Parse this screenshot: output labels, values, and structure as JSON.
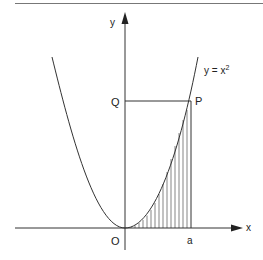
{
  "diagram": {
    "curve_label": "y = x",
    "curve_exponent": "2",
    "axis_x_label": "x",
    "axis_y_label": "y",
    "origin_label": "O",
    "point_a_label": "a",
    "point_p_label": "P",
    "point_q_label": "Q",
    "colors": {
      "line": "#333333",
      "background": "#ffffff"
    }
  }
}
